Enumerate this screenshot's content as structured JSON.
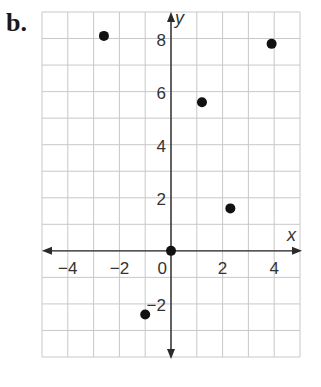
{
  "panel_label": "b.",
  "chart_data": {
    "type": "scatter",
    "title": "",
    "xlabel": "x",
    "ylabel": "y",
    "xlim": [
      -5,
      5
    ],
    "ylim": [
      -4,
      9
    ],
    "grid": true,
    "x_ticks": [
      -4,
      -2,
      0,
      2,
      4
    ],
    "x_tick_labels": [
      "−4",
      "−2",
      "0",
      "2",
      "4"
    ],
    "y_ticks": [
      -2,
      2,
      4,
      6,
      8
    ],
    "y_tick_labels": [
      "−2",
      "2",
      "4",
      "6",
      "8"
    ],
    "points": [
      {
        "x": -2.6,
        "y": 8.1
      },
      {
        "x": 0,
        "y": 0
      },
      {
        "x": 1.2,
        "y": 5.6
      },
      {
        "x": 2.3,
        "y": 1.6
      },
      {
        "x": 3.9,
        "y": 7.8
      },
      {
        "x": -1.0,
        "y": -2.4
      }
    ]
  },
  "colors": {
    "grid": "#c8c8c8",
    "axis": "#2a2a2a",
    "point": "#111111",
    "text": "#333333"
  }
}
